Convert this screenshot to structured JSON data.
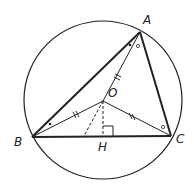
{
  "diagram": {
    "type": "geometry",
    "colors": {
      "stroke": "#222222",
      "background": "#ffffff"
    },
    "circle": {
      "center": "O",
      "cx": 103,
      "cy": 100,
      "r": 79
    },
    "points": {
      "A": {
        "label": "A",
        "x": 140,
        "y": 32
      },
      "B": {
        "label": "B",
        "x": 32,
        "y": 137
      },
      "C": {
        "label": "C",
        "x": 171,
        "y": 136
      },
      "O": {
        "label": "O",
        "x": 103,
        "y": 101
      },
      "H": {
        "label": "H",
        "x": 103,
        "y": 136
      }
    },
    "segments": [
      {
        "from": "A",
        "to": "B",
        "style": "thick"
      },
      {
        "from": "A",
        "to": "C",
        "style": "thick"
      },
      {
        "from": "B",
        "to": "C",
        "style": "thick"
      },
      {
        "from": "O",
        "to": "A",
        "style": "thin",
        "tick": "double"
      },
      {
        "from": "O",
        "to": "B",
        "style": "thin",
        "tick": "double"
      },
      {
        "from": "O",
        "to": "C",
        "style": "thin",
        "tick": "double"
      },
      {
        "from": "O",
        "to": "H",
        "style": "dashed"
      },
      {
        "from": "O",
        "to": "BC-point",
        "style": "dashed"
      }
    ],
    "angle_marks": [
      {
        "vertex": "A",
        "between": "AB-AO",
        "mark": "dot"
      },
      {
        "vertex": "A",
        "between": "AO-AC",
        "mark": "circle"
      },
      {
        "vertex": "B",
        "between": "BA-BO",
        "mark": "dot"
      },
      {
        "vertex": "C",
        "between": "CO-CA",
        "mark": "circle"
      },
      {
        "vertex": "H",
        "mark": "right-angle"
      }
    ]
  }
}
